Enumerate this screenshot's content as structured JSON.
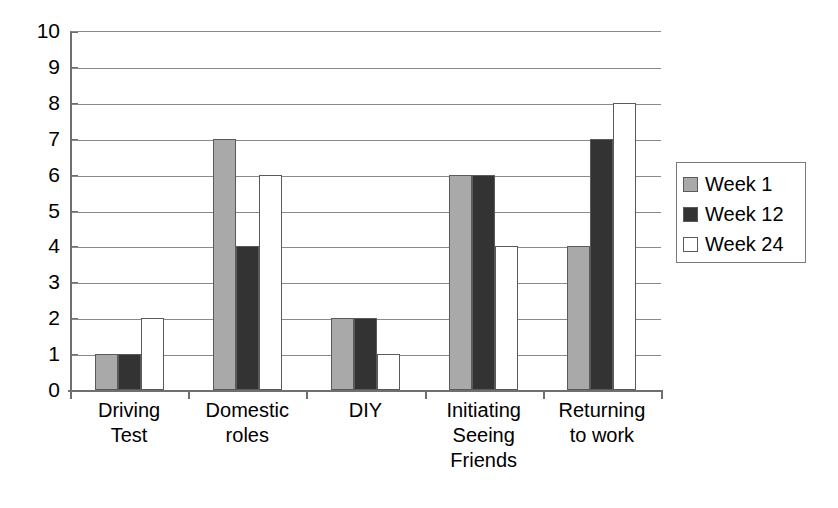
{
  "chart_data": {
    "type": "bar",
    "title": "",
    "subtitle": "",
    "xlabel": "",
    "ylabel": "",
    "ylim": [
      0,
      10
    ],
    "ytick_labels": [
      "0",
      "1",
      "2",
      "3",
      "4",
      "5",
      "6",
      "7",
      "8",
      "9",
      "10"
    ],
    "ytick_values": [
      0,
      1,
      2,
      3,
      4,
      5,
      6,
      7,
      8,
      9,
      10
    ],
    "grid": true,
    "legend_position": "right",
    "categories": [
      "Driving\nTest",
      "Domestic\nroles",
      "DIY",
      "Initiating\nSeeing\nFriends",
      "Returning\nto work"
    ],
    "series": [
      {
        "name": "Week 1",
        "color": "#a9a9a9",
        "values": [
          1,
          7,
          2,
          6,
          4
        ]
      },
      {
        "name": "Week 12",
        "color": "#333333",
        "values": [
          1,
          4,
          2,
          6,
          7
        ]
      },
      {
        "name": "Week 24",
        "color": "#ffffff",
        "values": [
          2,
          6,
          1,
          4,
          8
        ]
      }
    ]
  },
  "legend": {
    "items": [
      {
        "label": "Week 1",
        "color": "#a9a9a9"
      },
      {
        "label": "Week 12",
        "color": "#333333"
      },
      {
        "label": "Week 24",
        "color": "#ffffff"
      }
    ]
  },
  "axes": {
    "y_max": 10,
    "y_min": 0,
    "axis_color": "#6f6f6f",
    "gridline_color": "#8a8a8a"
  }
}
